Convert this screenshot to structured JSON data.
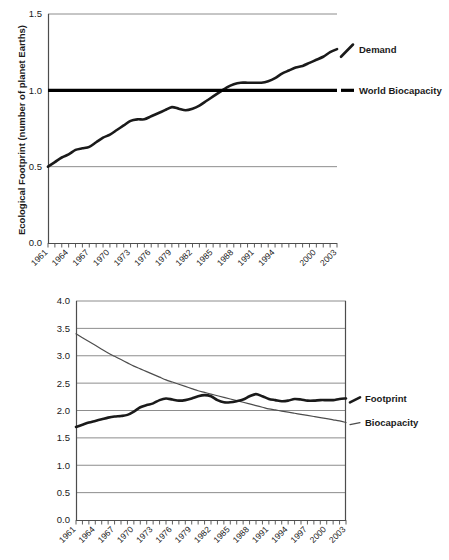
{
  "chart_data": [
    {
      "type": "line",
      "id": "ecological-footprint-planet-earths",
      "title": "",
      "xlabel": "",
      "ylabel": "Ecological Footprint (number of planet  Earths)",
      "ylim": [
        0.0,
        1.5
      ],
      "yticks": [
        0.0,
        0.5,
        1.0,
        1.5
      ],
      "ytick_labels": [
        "0.0",
        "0.5",
        "1.0",
        "1.5"
      ],
      "grid": "horizontal",
      "legend_position": "right-of-plot",
      "x": [
        1961,
        1962,
        1963,
        1964,
        1965,
        1966,
        1967,
        1968,
        1969,
        1970,
        1971,
        1972,
        1973,
        1974,
        1975,
        1976,
        1977,
        1978,
        1979,
        1980,
        1981,
        1982,
        1983,
        1984,
        1985,
        1986,
        1987,
        1988,
        1989,
        1990,
        1991,
        1992,
        1993,
        1994,
        1995,
        1996,
        1997,
        1998,
        1999,
        2000,
        2001,
        2002,
        2003
      ],
      "xtick_labels": [
        "1961",
        "1964",
        "1967",
        "1970",
        "1973",
        "1976",
        "1979",
        "1982",
        "1985",
        "1988",
        "1991",
        "1994",
        "2000",
        "2003"
      ],
      "series": [
        {
          "name": "Demand",
          "style": "thick",
          "values": [
            0.5,
            0.53,
            0.56,
            0.58,
            0.61,
            0.62,
            0.63,
            0.66,
            0.69,
            0.71,
            0.74,
            0.77,
            0.8,
            0.81,
            0.81,
            0.83,
            0.85,
            0.87,
            0.89,
            0.88,
            0.87,
            0.88,
            0.9,
            0.93,
            0.96,
            0.99,
            1.02,
            1.04,
            1.05,
            1.05,
            1.05,
            1.05,
            1.06,
            1.08,
            1.11,
            1.13,
            1.15,
            1.16,
            1.18,
            1.2,
            1.22,
            1.25,
            1.27
          ]
        },
        {
          "name": "World Biocapacity",
          "style": "flat",
          "constant": 1.0
        }
      ]
    },
    {
      "type": "line",
      "id": "global-hectares-per-person",
      "title": "",
      "xlabel": "",
      "ylabel": "Global hectares per person",
      "ylim": [
        0.0,
        4.0
      ],
      "yticks": [
        0.0,
        0.5,
        1.0,
        1.5,
        2.0,
        2.5,
        3.0,
        3.5,
        4.0
      ],
      "ytick_labels": [
        "0.0",
        "0.5",
        "1.0",
        "1.5",
        "2.0",
        "2.5",
        "3.0",
        "3.5",
        "4.0"
      ],
      "grid": "horizontal",
      "legend_position": "right-of-plot",
      "x": [
        1961,
        1962,
        1963,
        1964,
        1965,
        1966,
        1967,
        1968,
        1969,
        1970,
        1971,
        1972,
        1973,
        1974,
        1975,
        1976,
        1977,
        1978,
        1979,
        1980,
        1981,
        1982,
        1983,
        1984,
        1985,
        1986,
        1987,
        1988,
        1989,
        1990,
        1991,
        1992,
        1993,
        1994,
        1995,
        1996,
        1997,
        1998,
        1999,
        2000,
        2001,
        2002,
        2003
      ],
      "xtick_labels": [
        "1961",
        "1964",
        "1967",
        "1970",
        "1973",
        "1976",
        "1979",
        "1982",
        "1985",
        "1988",
        "1991",
        "1994",
        "1997",
        "2000",
        "2003"
      ],
      "series": [
        {
          "name": "Footprint",
          "style": "thick",
          "values": [
            1.7,
            1.74,
            1.78,
            1.81,
            1.84,
            1.87,
            1.89,
            1.9,
            1.92,
            1.98,
            2.06,
            2.1,
            2.13,
            2.19,
            2.22,
            2.2,
            2.18,
            2.19,
            2.22,
            2.26,
            2.28,
            2.26,
            2.19,
            2.15,
            2.15,
            2.17,
            2.2,
            2.26,
            2.3,
            2.26,
            2.21,
            2.19,
            2.17,
            2.18,
            2.21,
            2.2,
            2.18,
            2.18,
            2.19,
            2.19,
            2.19,
            2.21,
            2.22
          ]
        },
        {
          "name": "Biocapacity",
          "style": "thin",
          "values": [
            3.4,
            3.33,
            3.26,
            3.19,
            3.12,
            3.05,
            2.99,
            2.93,
            2.87,
            2.81,
            2.76,
            2.71,
            2.66,
            2.61,
            2.56,
            2.52,
            2.48,
            2.44,
            2.4,
            2.36,
            2.33,
            2.3,
            2.27,
            2.24,
            2.21,
            2.18,
            2.15,
            2.12,
            2.09,
            2.06,
            2.03,
            2.01,
            1.99,
            1.97,
            1.95,
            1.93,
            1.91,
            1.89,
            1.87,
            1.85,
            1.83,
            1.81,
            1.78
          ]
        }
      ]
    }
  ],
  "top_chart": {
    "ylabel": "Ecological Footprint (number of planet  Earths)",
    "ytick_labels": [
      "1.5",
      "1.0",
      "0.5",
      "0.0"
    ],
    "xtick_labels": [
      "1961",
      "1964",
      "1967",
      "1970",
      "1973",
      "1976",
      "1979",
      "1982",
      "1985",
      "1988",
      "1991",
      "1994",
      "2000",
      "2003"
    ],
    "legend": {
      "demand": "Demand",
      "biocapacity": "World Biocapacity"
    }
  },
  "bottom_chart": {
    "ylabel": "Global hectares per person",
    "ytick_labels": [
      "4.0",
      "3.5",
      "3.0",
      "2.5",
      "2.0",
      "1.5",
      "1.0",
      "0.5",
      "0.0"
    ],
    "xtick_labels": [
      "1961",
      "1964",
      "1967",
      "1970",
      "1973",
      "1976",
      "1979",
      "1982",
      "1985",
      "1988",
      "1991",
      "1994",
      "1997",
      "2000",
      "2003"
    ],
    "legend": {
      "footprint": "Footprint",
      "biocapacity": "Biocapacity"
    }
  },
  "colors": {
    "ink": "#1a1a1a",
    "grid": "#808080",
    "axis": "#4d4d4d",
    "thick_line": "#1a1a1a",
    "thin_line": "#4d4d4d",
    "background": "#ffffff"
  }
}
